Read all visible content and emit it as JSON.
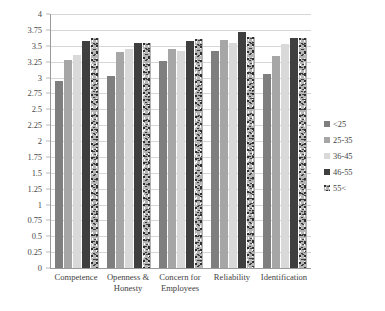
{
  "chart_data": {
    "type": "bar",
    "title": "",
    "subtitle": "",
    "xlabel": "",
    "ylabel": "",
    "ylim": [
      0,
      4
    ],
    "ystep": 0.25,
    "grid": true,
    "legend_position": "right",
    "y_ticks": [
      "4",
      "3.75",
      "3.5",
      "3.25",
      "3",
      "2.75",
      "2.5",
      "2.25",
      "2",
      "1.75",
      "1.5",
      "1.25",
      "1",
      "0.75",
      "0.5",
      "0.25",
      "0"
    ],
    "y_tick_values": [
      4,
      3.75,
      3.5,
      3.25,
      3,
      2.75,
      2.5,
      2.25,
      2,
      1.75,
      1.5,
      1.25,
      1,
      0.75,
      0.5,
      0.25,
      0
    ],
    "categories": [
      "Competence",
      "Openness & Honesty",
      "Concern for Employees",
      "Reliability",
      "Identification"
    ],
    "series": [
      {
        "name": "<25",
        "color": "#7f7f7f",
        "values": [
          2.95,
          3.03,
          3.26,
          3.42,
          3.06
        ]
      },
      {
        "name": "25-35",
        "color": "#a6a6a6",
        "values": [
          3.28,
          3.4,
          3.45,
          3.59,
          3.34
        ]
      },
      {
        "name": "36-45",
        "color": "#d9d9d9",
        "values": [
          3.35,
          3.45,
          3.42,
          3.55,
          3.52
        ]
      },
      {
        "name": "46-55",
        "color": "#3f3f3f",
        "values": [
          3.57,
          3.54,
          3.58,
          3.72,
          3.62
        ]
      },
      {
        "name": "55<",
        "color": "#b5b5b5",
        "values": [
          3.62,
          3.55,
          3.6,
          3.64,
          3.63
        ]
      }
    ]
  },
  "legend": {
    "items": [
      {
        "label": "<25"
      },
      {
        "label": "25-35"
      },
      {
        "label": "36-45"
      },
      {
        "label": "46-55"
      },
      {
        "label": "55<"
      }
    ]
  }
}
